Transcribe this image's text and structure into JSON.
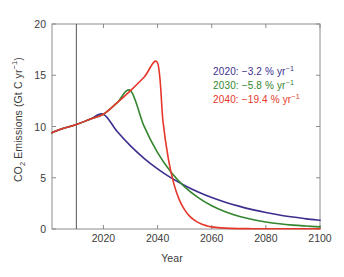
{
  "chart_data": {
    "type": "line",
    "title": "",
    "xlabel": "Year",
    "ylabel_parts": {
      "pre": "CO",
      "sub": "2",
      "mid": " Emissions (Gt C yr",
      "sup": "−1",
      "post": ")"
    },
    "ylabel_plain": "CO2 Emissions (Gt C yr-1)",
    "xlim": [
      2001,
      2100
    ],
    "ylim": [
      0,
      20
    ],
    "xticks": [
      2020,
      2040,
      2060,
      2080,
      2100
    ],
    "xtick_labels": [
      "2020",
      "2040",
      "2060",
      "2080",
      "2100"
    ],
    "yticks": [
      0,
      5,
      10,
      15,
      20
    ],
    "ytick_labels": [
      "0",
      "5",
      "10",
      "15",
      "20"
    ],
    "grid": false,
    "legend_position": "upper-right-inside",
    "reference_line": {
      "x": 2010,
      "color": "#555555",
      "label": ""
    },
    "series": [
      {
        "name": "2020",
        "legend_year": "2020",
        "legend_rate": "−3.2",
        "peak_year": 2020,
        "peak_value": 11.2,
        "color": "#3b2f8f",
        "x": [
          2001,
          2005,
          2010,
          2015,
          2020,
          2025,
          2030,
          2035,
          2040,
          2045,
          2050,
          2055,
          2060,
          2065,
          2070,
          2075,
          2080,
          2085,
          2090,
          2095,
          2100
        ],
        "y": [
          9.4,
          9.8,
          10.2,
          10.7,
          11.2,
          9.53,
          8.11,
          6.9,
          5.87,
          4.99,
          4.25,
          3.61,
          3.07,
          2.62,
          2.23,
          1.89,
          1.61,
          1.37,
          1.17,
          0.99,
          0.85
        ]
      },
      {
        "name": "2030",
        "legend_year": "2030",
        "legend_rate": "−5.8",
        "peak_year": 2030,
        "peak_value": 13.5,
        "color": "#35852f",
        "x": [
          2001,
          2005,
          2010,
          2015,
          2020,
          2025,
          2030,
          2035,
          2040,
          2045,
          2050,
          2055,
          2060,
          2065,
          2070,
          2075,
          2080,
          2085,
          2090,
          2095,
          2100
        ],
        "y": [
          9.4,
          9.8,
          10.2,
          10.7,
          11.2,
          12.3,
          13.5,
          10.03,
          7.45,
          5.54,
          4.11,
          3.06,
          2.27,
          1.69,
          1.25,
          0.93,
          0.69,
          0.51,
          0.38,
          0.29,
          0.21
        ]
      },
      {
        "name": "2040",
        "legend_year": "2040",
        "legend_rate": "−19.4",
        "peak_year": 2040,
        "peak_value": 16.2,
        "color": "#e5372b",
        "x": [
          2001,
          2005,
          2010,
          2015,
          2020,
          2025,
          2030,
          2035,
          2040,
          2042,
          2044,
          2046,
          2048,
          2050,
          2052,
          2054,
          2056,
          2058,
          2060,
          2065,
          2070,
          2075,
          2080,
          2090,
          2100
        ],
        "y": [
          9.4,
          9.8,
          10.2,
          10.7,
          11.2,
          12.3,
          13.5,
          14.8,
          16.2,
          10.5,
          6.82,
          4.43,
          2.87,
          1.87,
          1.21,
          0.79,
          0.51,
          0.33,
          0.21,
          0.09,
          0.04,
          0.03,
          0.02,
          0.02,
          0.02
        ]
      }
    ],
    "annotations": [
      {
        "text_year": "2020",
        "text_rate": "−3.2",
        "unit_pre": " % yr",
        "unit_sup": "−1",
        "color": "#3b2f8f"
      },
      {
        "text_year": "2030",
        "text_rate": "−5.8",
        "unit_pre": " % yr",
        "unit_sup": "−1",
        "color": "#35852f"
      },
      {
        "text_year": "2040",
        "text_rate": "−19.4",
        "unit_pre": " % yr",
        "unit_sup": "−1",
        "color": "#e5372b"
      }
    ]
  },
  "axes": {
    "xlabel": "Year",
    "x_tick_0": "2020",
    "x_tick_1": "2040",
    "x_tick_2": "2060",
    "x_tick_3": "2080",
    "x_tick_4": "2100",
    "y_tick_0": "0",
    "y_tick_1": "5",
    "y_tick_2": "10",
    "y_tick_3": "15",
    "y_tick_4": "20",
    "ylabel_pre": "CO",
    "ylabel_sub": "2",
    "ylabel_mid": " Emissions (Gt C yr",
    "ylabel_sup": "−1",
    "ylabel_post": ")"
  },
  "legend": {
    "items": [
      {
        "year": "2020:",
        "rate": " −3.2 % yr",
        "sup": "−1",
        "color": "#3b2f8f"
      },
      {
        "year": "2030:",
        "rate": " −5.8 % yr",
        "sup": "−1",
        "color": "#35852f"
      },
      {
        "year": "2040:",
        "rate": " −19.4 % yr",
        "sup": "−1",
        "color": "#e5372b"
      }
    ]
  }
}
